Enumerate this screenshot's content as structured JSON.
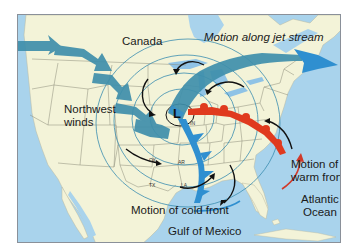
{
  "diagram": {
    "labels": {
      "canada": "Canada",
      "jet_stream": "Motion along jet stream",
      "northwest_winds_line1": "Northwest",
      "northwest_winds_line2": "winds",
      "warm_front_line1": "Motion of",
      "warm_front_line2": "warm front",
      "cold_front": "Motion of cold front",
      "atlantic_line1": "Atlantic",
      "atlantic_line2": "Ocean",
      "gulf": "Gulf of Mexico",
      "low_pressure": "L"
    },
    "state_labels": {
      "ok": "OK",
      "ar": "AR",
      "tx": "TX",
      "la": "LA",
      "in": "IN"
    },
    "colors": {
      "ocean": "#a9d3ec",
      "land": "#f3f3d8",
      "jet_stream": "#3f8fab",
      "jet_stream_tip": "#2f8fd0",
      "isobar": "#3a8db0",
      "cold_front": "#2f8fd0",
      "warm_front": "#e03a1e",
      "wind_arrow": "#111111",
      "border": "#8a9099"
    }
  }
}
